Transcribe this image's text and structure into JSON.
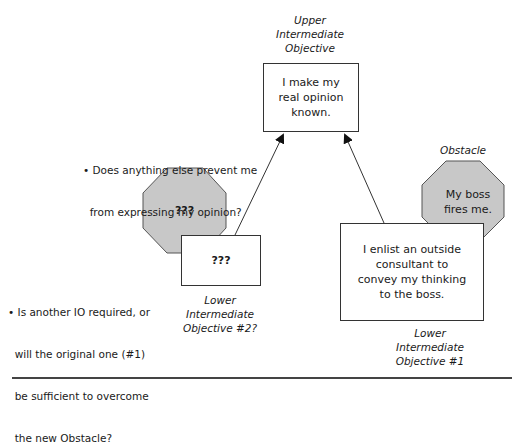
{
  "diagram": {
    "upper_objective": {
      "label_lines": [
        "Upper",
        "Intermediate",
        "Objective"
      ],
      "text_lines": [
        "I make my",
        "real opinion",
        "known."
      ]
    },
    "left_obstacle": {
      "text": "???",
      "fill": "#c8c8c8"
    },
    "lower_objective_2": {
      "text": "???",
      "label_lines": [
        "Lower",
        "Intermediate",
        "Objective #2?"
      ]
    },
    "right_obstacle": {
      "label": "Obstacle",
      "text_lines": [
        "My boss",
        "fires me."
      ],
      "fill": "#c8c8c8"
    },
    "lower_objective_1": {
      "text_lines": [
        "I enlist an outside",
        "consultant to",
        "convey my thinking",
        "to the boss."
      ],
      "label_lines": [
        "Lower",
        "Intermediate",
        "Objective #1"
      ]
    },
    "questions": [
      {
        "lines": [
          "• Does anything else prevent me",
          "  from expressing my opinion?"
        ]
      },
      {
        "lines": [
          "• Is another IO required, or",
          "  will the original one (#1)",
          "  be sufficient to overcome",
          "  the new Obstacle?"
        ]
      }
    ]
  }
}
